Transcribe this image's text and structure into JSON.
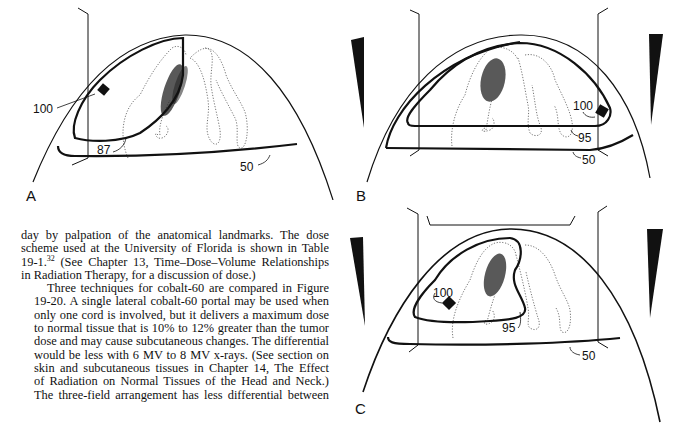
{
  "figure": {
    "panels": [
      {
        "id": "A",
        "label": "A",
        "description": "Single lateral cobalt-60 portal",
        "isodose_labels": [
          "100",
          "87",
          "50"
        ]
      },
      {
        "id": "B",
        "label": "B",
        "description": "Parallel opposed fields with wedges",
        "isodose_labels": [
          "100",
          "95",
          "50"
        ]
      },
      {
        "id": "C",
        "label": "C",
        "description": "Three-field arrangement with wedges",
        "isodose_labels": [
          "100",
          "95",
          "50"
        ]
      }
    ]
  },
  "text": {
    "paragraph1": {
      "lines": [
        "day by palpation of the anatomical landmarks. The dose",
        "scheme used at the University of Florida is shown in Table",
        "19-1.",
        "in Radiation Therapy, for a discussion of dose.)"
      ],
      "line3_sup": "32",
      "line3_rest": " (See Chapter 13, Time–Dose–Volume Relationships"
    },
    "paragraph2": {
      "lines": [
        "Three techniques for cobalt-60 are compared in Figure",
        "19-20. A single lateral cobalt-60 portal may be used when",
        "only one cord is involved, but it delivers a maximum dose",
        "to normal tissue that is 10% to 12% greater than the tumor",
        "dose and may cause subcutaneous changes. The differential",
        "would be less with 6 MV to 8 MV x-rays. (See section on",
        "skin and subcutaneous tissues in Chapter 14, The Effect",
        "of Radiation on Normal Tissues of the Head and Neck.)",
        "The three-field arrangement has less differential between"
      ]
    }
  }
}
